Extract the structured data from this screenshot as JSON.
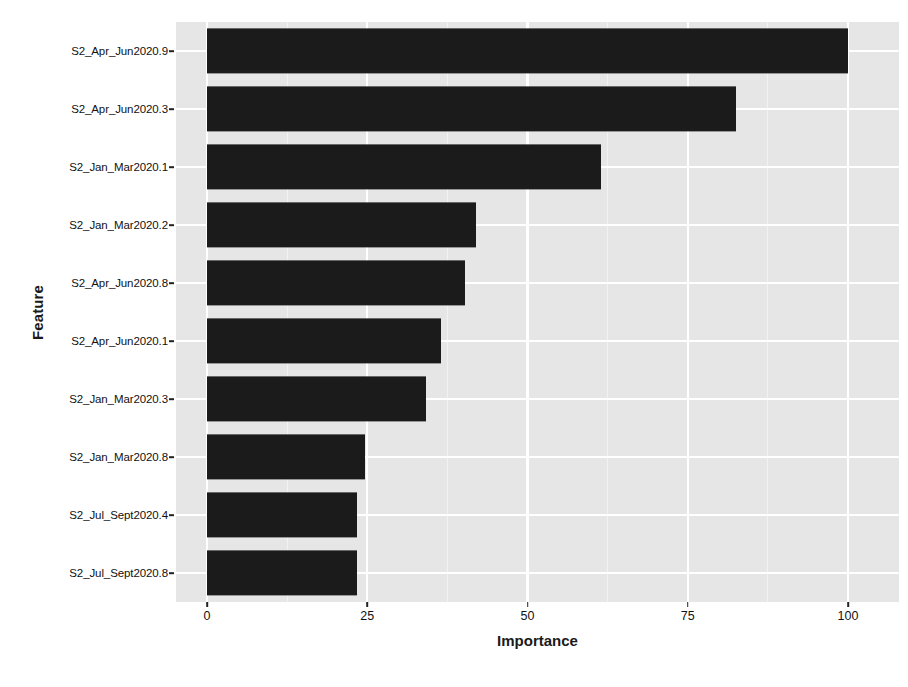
{
  "chart_data": {
    "type": "bar",
    "orientation": "horizontal",
    "title": "",
    "xlabel": "Importance",
    "ylabel": "Feature",
    "xlim": [
      0,
      104
    ],
    "xticks": [
      0,
      25,
      50,
      75,
      100
    ],
    "xtick_labels": [
      "0",
      "25",
      "50",
      "75",
      "100"
    ],
    "x_minor_ticks": [
      12.5,
      37.5,
      62.5,
      87.5
    ],
    "grid": true,
    "grid_color": "#ffffff",
    "panel_background": "#e6e6e6",
    "bar_color": "#1b1b1b",
    "legend": "none",
    "categories": [
      "S2_Apr_Jun2020.9",
      "S2_Apr_Jun2020.3",
      "S2_Jan_Mar2020.1",
      "S2_Jan_Mar2020.2",
      "S2_Apr_Jun2020.8",
      "S2_Apr_Jun2020.1",
      "S2_Jan_Mar2020.3",
      "S2_Jan_Mar2020.8",
      "S2_Jul_Sept2020.4",
      "S2_Jul_Sept2020.8"
    ],
    "values": [
      100.0,
      82.5,
      61.5,
      42.0,
      40.3,
      36.5,
      34.2,
      24.7,
      23.4,
      23.4
    ]
  }
}
